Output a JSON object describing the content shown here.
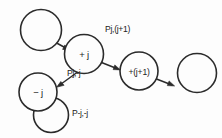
{
  "diagram": {
    "type": "state-transition-graph",
    "style": "hand-drawn",
    "background_color": "#fdfdfd",
    "ink_color": "#2b2b2b",
    "nodes": [
      {
        "id": "prev",
        "label": "",
        "cx": 41,
        "cy": 30,
        "r": 20.5,
        "empty": true
      },
      {
        "id": "plus_j",
        "label": "+ j",
        "cx": 84,
        "cy": 54,
        "r": 19.5,
        "empty": false
      },
      {
        "id": "plus_j1",
        "label": "+(j+1)",
        "cx": 139,
        "cy": 71,
        "r": 19.0,
        "empty": false
      },
      {
        "id": "next",
        "label": "",
        "cx": 197,
        "cy": 73,
        "r": 19.5,
        "empty": true
      },
      {
        "id": "minus_j",
        "label": "− j",
        "cx": 38,
        "cy": 92,
        "r": 19.0,
        "empty": false
      }
    ],
    "edges": [
      {
        "id": "e_prev_to_plusj",
        "from": "prev",
        "to": "plus_j",
        "label": ""
      },
      {
        "id": "e_plusj_to_plusj1",
        "from": "plus_j",
        "to": "plus_j1",
        "label": "Pj,(j+1)"
      },
      {
        "id": "e_plusj1_to_next",
        "from": "plus_j1",
        "to": "next",
        "label": ""
      },
      {
        "id": "e_plusj_to_minusj",
        "from": "plus_j",
        "to": "minus_j",
        "label": "Pj,-j"
      },
      {
        "id": "e_minusj_self_loop",
        "from": "minus_j",
        "to": "minus_j",
        "label": "P-j,-j",
        "self_loop": true
      }
    ],
    "labels": {
      "p_j_jplus1": "Pj,(j+1)",
      "p_j_minusj": "Pj,-j",
      "p_minusj_minusj": "P-j,-j"
    }
  }
}
